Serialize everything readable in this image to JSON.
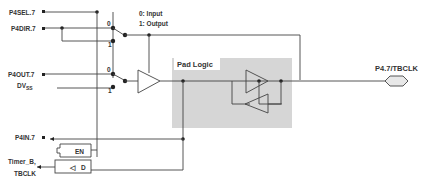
{
  "diagram": {
    "signals_left": {
      "sel": "P4SEL.7",
      "dir": "P4DIR.7",
      "out": "P4OUT.7",
      "dvss_main": "DV",
      "dvss_sub": "SS",
      "in": "P4IN.7",
      "timer_line1": "Timer_B,",
      "timer_line2": "TBCLK"
    },
    "mux_labels": {
      "zero": "0",
      "one": "1"
    },
    "legend": {
      "line1": "0: Input",
      "line2": "1: Output"
    },
    "pad_logic": "Pad Logic",
    "pin": "P4.7/TBCLK",
    "latch": {
      "en": "EN",
      "d": "D",
      "clk_symbol": "◁"
    },
    "colors": {
      "pad_bg": "#d9d9d9",
      "wire": "#444444"
    }
  }
}
